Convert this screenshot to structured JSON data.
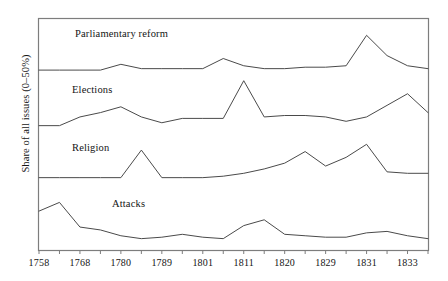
{
  "figure": {
    "ylabel": "Share of all issues (0–50%)",
    "caption": "",
    "frame_color": "#7d7d7d",
    "line_color": "#4a4a4a",
    "background": "#ffffff"
  },
  "chart_data": {
    "type": "line",
    "title": "",
    "xlabel": "",
    "ylabel": "Share of all issues (0–50%)",
    "grid": false,
    "legend_position": "inline",
    "ylim": [
      0,
      50
    ],
    "axis_ticks": [
      "1758",
      "",
      "1768",
      "",
      "1780",
      "",
      "1789",
      "",
      "1801",
      "",
      "1811",
      "",
      "1820",
      "",
      "1829",
      "",
      "1831",
      "",
      "1833",
      ""
    ],
    "tick_labels": [
      "1758",
      "1768",
      "1780",
      "1789",
      "1801",
      "1811",
      "1820",
      "1829",
      "1831",
      "1833"
    ],
    "x": [
      "1758",
      "1763",
      "1768",
      "1774",
      "1780",
      "1784",
      "1789",
      "1796",
      "1801",
      "1806",
      "1811",
      "1816",
      "1820",
      "1825",
      "1829",
      "1830",
      "1831",
      "1832",
      "1833",
      "1834"
    ],
    "series": [
      {
        "name": "Parliamentary reform",
        "label_position": {
          "x": 75,
          "y": 28
        },
        "baseline_y": 73,
        "values": [
          2,
          2,
          2,
          2,
          6,
          3,
          3,
          3,
          3,
          10,
          5,
          3,
          3,
          4,
          4,
          5,
          26,
          12,
          5,
          3
        ]
      },
      {
        "name": "Elections",
        "label_position": {
          "x": 72,
          "y": 84
        },
        "baseline_y": 130,
        "values": [
          3,
          3,
          9,
          12,
          16,
          9,
          5,
          8,
          8,
          8,
          34,
          9,
          10,
          10,
          9,
          6,
          9,
          17,
          25,
          12
        ]
      },
      {
        "name": "Religion",
        "label_position": {
          "x": 72,
          "y": 142
        },
        "baseline_y": 182,
        "values": [
          3,
          3,
          3,
          3,
          3,
          22,
          3,
          3,
          3,
          4,
          6,
          9,
          13,
          21,
          11,
          17,
          26,
          7,
          6,
          6
        ]
      },
      {
        "name": "Attacks",
        "label_position": {
          "x": 112,
          "y": 198
        },
        "baseline_y": 243,
        "values": [
          22,
          28,
          11,
          9,
          5,
          3,
          4,
          6,
          4,
          3,
          12,
          16,
          6,
          5,
          4,
          4,
          7,
          8,
          5,
          3
        ]
      }
    ]
  }
}
